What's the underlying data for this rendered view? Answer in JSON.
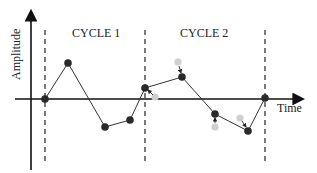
{
  "diagram": {
    "y_axis_label": "Amplitude",
    "x_axis_label": "Time",
    "cycles": [
      {
        "label": "CYCLE 1"
      },
      {
        "label": "CYCLE 2"
      }
    ],
    "colors": {
      "axis": "#111111",
      "line": "#333333",
      "point": "#2a2a2a",
      "ghost_point": "#c8c8c8",
      "dashed": "#333333"
    }
  }
}
